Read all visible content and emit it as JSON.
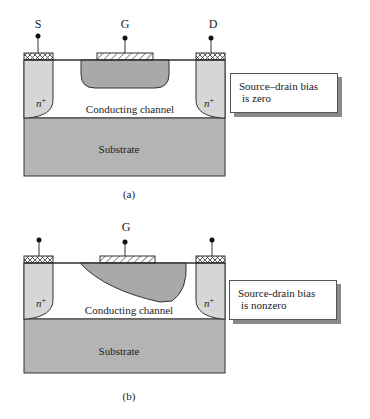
{
  "panel_a": {
    "terminals": {
      "source": "S",
      "gate": "G",
      "drain": "D"
    },
    "left_region": "n+",
    "right_region": "n+",
    "channel_label": "Conducting channel",
    "substrate_label": "Substrate",
    "callout": {
      "line1": "Source–drain bias",
      "line2": "is zero"
    },
    "caption": "(a)"
  },
  "panel_b": {
    "terminals": {
      "gate": "G"
    },
    "left_region": "n+",
    "right_region": "n+",
    "channel_label": "Conducting channel",
    "substrate_label": "Substrate",
    "callout": {
      "line1": "Source-drain bias",
      "line2": "is nonzero"
    },
    "caption": "(b)"
  },
  "colors": {
    "n_region": "#d6d6d6",
    "depletion": "#a9a9a9",
    "substrate": "#b4b4b4",
    "outline": "#333333"
  }
}
